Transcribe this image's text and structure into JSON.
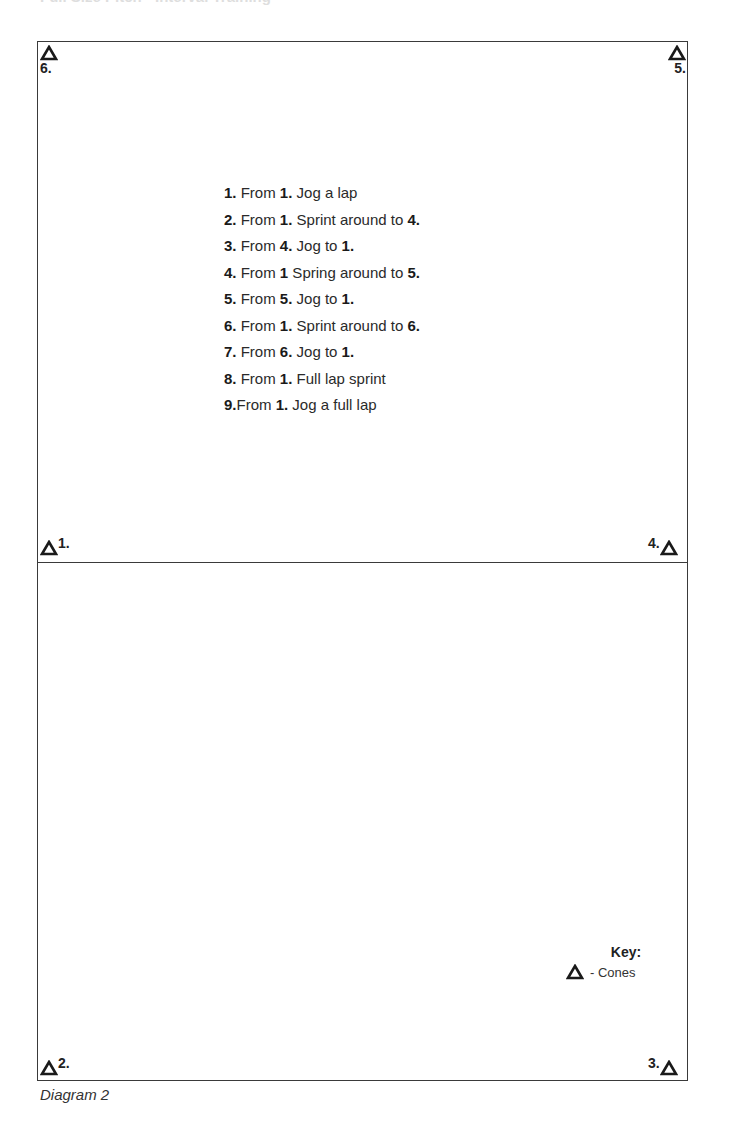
{
  "header": {
    "title_clipped": "Full Size Pitch - Interval Training"
  },
  "diagram": {
    "caption": "Diagram 2",
    "colors": {
      "line": "#3a3a3a",
      "text": "#222222",
      "background": "#ffffff"
    },
    "cones": [
      {
        "id": 1,
        "label": "1.",
        "position": "left-halfway"
      },
      {
        "id": 2,
        "label": "2.",
        "position": "bottom-left"
      },
      {
        "id": 3,
        "label": "3.",
        "position": "bottom-right"
      },
      {
        "id": 4,
        "label": "4.",
        "position": "right-halfway"
      },
      {
        "id": 5,
        "label": "5.",
        "position": "top-right"
      },
      {
        "id": 6,
        "label": "6.",
        "position": "top-left"
      }
    ],
    "instructions": [
      {
        "num": "1.",
        "parts": [
          " From ",
          "1.",
          " Jog a lap",
          "",
          ""
        ]
      },
      {
        "num": "2.",
        "parts": [
          " From ",
          "1.",
          " Sprint around to ",
          "4.",
          ""
        ]
      },
      {
        "num": "3.",
        "parts": [
          " From ",
          "4.",
          " Jog to ",
          "1.",
          ""
        ]
      },
      {
        "num": "4.",
        "parts": [
          " From ",
          "1",
          " Spring around to ",
          "5.",
          ""
        ]
      },
      {
        "num": "5.",
        "parts": [
          " From ",
          "5.",
          " Jog to ",
          "1.",
          ""
        ]
      },
      {
        "num": "6.",
        "parts": [
          " From ",
          "1.",
          " Sprint around to ",
          "6.",
          ""
        ]
      },
      {
        "num": "7.",
        "parts": [
          " From ",
          "6.",
          " Jog to ",
          "1.",
          ""
        ]
      },
      {
        "num": "8.",
        "parts": [
          " From ",
          "1.",
          " Full lap sprint",
          "",
          ""
        ]
      },
      {
        "num": "9.",
        "parts": [
          "From ",
          "1.",
          " Jog a full lap",
          "",
          ""
        ]
      }
    ],
    "key": {
      "title": "Key:",
      "symbol_icon": "cone-triangle-icon",
      "entries": [
        {
          "label": "-  Cones"
        }
      ]
    }
  }
}
